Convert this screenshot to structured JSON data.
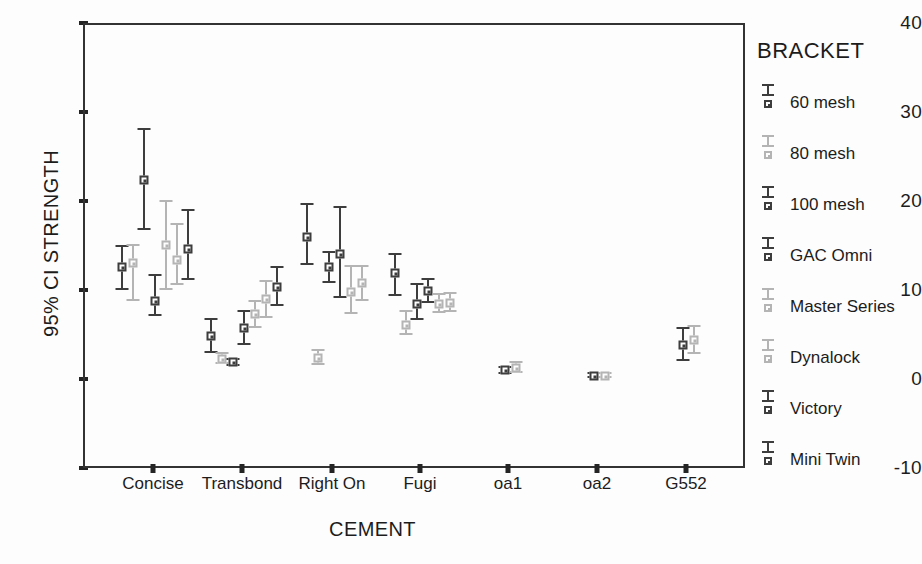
{
  "chart_data": {
    "type": "scatter",
    "title": "",
    "xlabel": "CEMENT",
    "ylabel": "95% CI STRENGTH",
    "ylim": [
      -10,
      40
    ],
    "yticks": [
      40,
      30,
      20,
      10,
      0,
      -10
    ],
    "ytick_labels": [
      "40",
      "30",
      "20",
      "10",
      "0",
      "-10"
    ],
    "categories": [
      "Concise",
      "Transbond",
      "Right On",
      "Fugi",
      "oa1",
      "oa2",
      "G552"
    ],
    "grid": false,
    "legend_position": "right",
    "legend_title": "BRACKET",
    "annotation": "Error bars show 95% confidence interval of mean bond strength; square marker is the mean.",
    "colors": {
      "dark": "#3d3d3d",
      "light": "#b4b4b4",
      "axis": "#2a2a2a"
    },
    "series": [
      {
        "name": "60 mesh",
        "color": "dark",
        "marker": "square"
      },
      {
        "name": "80 mesh",
        "color": "light",
        "marker": "square-open"
      },
      {
        "name": "100 mesh",
        "color": "dark",
        "marker": "square"
      },
      {
        "name": "GAC Omni",
        "color": "dark",
        "marker": "square"
      },
      {
        "name": "Master Series",
        "color": "light",
        "marker": "square-open"
      },
      {
        "name": "Dynalock",
        "color": "light",
        "marker": "square-open"
      },
      {
        "name": "Victory",
        "color": "dark",
        "marker": "square"
      },
      {
        "name": "Mini Twin",
        "color": "dark",
        "marker": "square"
      }
    ],
    "points": [
      {
        "category": "Concise",
        "series": "60 mesh",
        "mean": 12.8,
        "low": 10.2,
        "high": 15.3
      },
      {
        "category": "Concise",
        "series": "80 mesh",
        "mean": 13.3,
        "low": 9.0,
        "high": 15.4
      },
      {
        "category": "Concise",
        "series": "100 mesh",
        "mean": 22.6,
        "low": 17.0,
        "high": 28.4
      },
      {
        "category": "Concise",
        "series": "GAC Omni",
        "mean": 9.0,
        "low": 7.3,
        "high": 12.0
      },
      {
        "category": "Concise",
        "series": "Master Series",
        "mean": 15.3,
        "low": 10.2,
        "high": 20.3
      },
      {
        "category": "Concise",
        "series": "Dynalock",
        "mean": 13.6,
        "low": 10.8,
        "high": 17.7
      },
      {
        "category": "Concise",
        "series": "Victory",
        "mean": 14.8,
        "low": 11.3,
        "high": 19.3
      },
      {
        "category": "Transbond",
        "series": "60 mesh",
        "mean": 5.1,
        "low": 3.1,
        "high": 7.1
      },
      {
        "category": "Transbond",
        "series": "80 mesh",
        "mean": 2.5,
        "low": 1.9,
        "high": 3.3
      },
      {
        "category": "Transbond",
        "series": "100 mesh",
        "mean": 2.1,
        "low": 1.7,
        "high": 2.6
      },
      {
        "category": "Transbond",
        "series": "GAC Omni",
        "mean": 5.9,
        "low": 4.1,
        "high": 8.0
      },
      {
        "category": "Transbond",
        "series": "Master Series",
        "mean": 7.5,
        "low": 6.0,
        "high": 9.1
      },
      {
        "category": "Transbond",
        "series": "Dynalock",
        "mean": 9.2,
        "low": 7.1,
        "high": 11.3
      },
      {
        "category": "Transbond",
        "series": "Victory",
        "mean": 10.6,
        "low": 8.4,
        "high": 12.9
      },
      {
        "category": "Right On",
        "series": "60 mesh",
        "mean": 16.2,
        "low": 13.0,
        "high": 20.0
      },
      {
        "category": "Right On",
        "series": "80 mesh",
        "mean": 2.6,
        "low": 1.8,
        "high": 3.6
      },
      {
        "category": "Right On",
        "series": "100 mesh",
        "mean": 12.8,
        "low": 11.0,
        "high": 14.6
      },
      {
        "category": "Right On",
        "series": "GAC Omni",
        "mean": 14.3,
        "low": 9.3,
        "high": 19.7
      },
      {
        "category": "Right On",
        "series": "Master Series",
        "mean": 10.0,
        "low": 7.5,
        "high": 13.0
      },
      {
        "category": "Right On",
        "series": "Dynalock",
        "mean": 11.0,
        "low": 9.0,
        "high": 13.0
      },
      {
        "category": "Fugi",
        "series": "60 mesh",
        "mean": 12.1,
        "low": 9.6,
        "high": 14.4
      },
      {
        "category": "Fugi",
        "series": "80 mesh",
        "mean": 6.3,
        "low": 5.2,
        "high": 8.0
      },
      {
        "category": "Fugi",
        "series": "100 mesh",
        "mean": 8.6,
        "low": 6.8,
        "high": 11.0
      },
      {
        "category": "Fugi",
        "series": "GAC Omni",
        "mean": 10.1,
        "low": 8.8,
        "high": 11.6
      },
      {
        "category": "Fugi",
        "series": "Master Series",
        "mean": 8.7,
        "low": 7.6,
        "high": 9.9
      },
      {
        "category": "Fugi",
        "series": "Dynalock",
        "mean": 8.8,
        "low": 7.8,
        "high": 10.0
      },
      {
        "category": "oa1",
        "series": "60 mesh",
        "mean": 1.2,
        "low": 0.8,
        "high": 1.7
      },
      {
        "category": "oa1",
        "series": "80 mesh",
        "mean": 1.5,
        "low": 0.9,
        "high": 2.3
      },
      {
        "category": "oa2",
        "series": "60 mesh",
        "mean": 0.6,
        "low": 0.3,
        "high": 1.0
      },
      {
        "category": "oa2",
        "series": "80 mesh",
        "mean": 0.6,
        "low": 0.3,
        "high": 1.0
      },
      {
        "category": "G552",
        "series": "60 mesh",
        "mean": 4.1,
        "low": 2.3,
        "high": 6.1
      },
      {
        "category": "G552",
        "series": "80 mesh",
        "mean": 4.6,
        "low": 3.0,
        "high": 6.3
      }
    ]
  }
}
